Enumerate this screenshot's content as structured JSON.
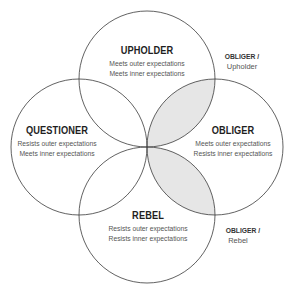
{
  "diagram": {
    "type": "four-circle venn",
    "colors": {
      "stroke": "#3a3a3a",
      "overlap_fill": "#e6e6e6",
      "background": "#ffffff"
    },
    "circles": [
      {
        "id": "upholder",
        "title": "UPHOLDER",
        "lines": [
          "Meets outer expectations",
          "Meets inner expectations"
        ]
      },
      {
        "id": "questioner",
        "title": "QUESTIONER",
        "lines": [
          "Resists outer expectations",
          "Meets inner expectations"
        ]
      },
      {
        "id": "obliger",
        "title": "OBLIGER",
        "lines": [
          "Meets outer expectations",
          "Resists inner expectations"
        ]
      },
      {
        "id": "rebel",
        "title": "REBEL",
        "lines": [
          "Resists outer expectations",
          "Resists inner expectations"
        ]
      }
    ],
    "overlaps": [
      {
        "title": "OBLIGER /",
        "sub": "Upholder",
        "shaded": true
      },
      {
        "title": "OBLIGER /",
        "sub": "Rebel",
        "shaded": true
      }
    ]
  }
}
